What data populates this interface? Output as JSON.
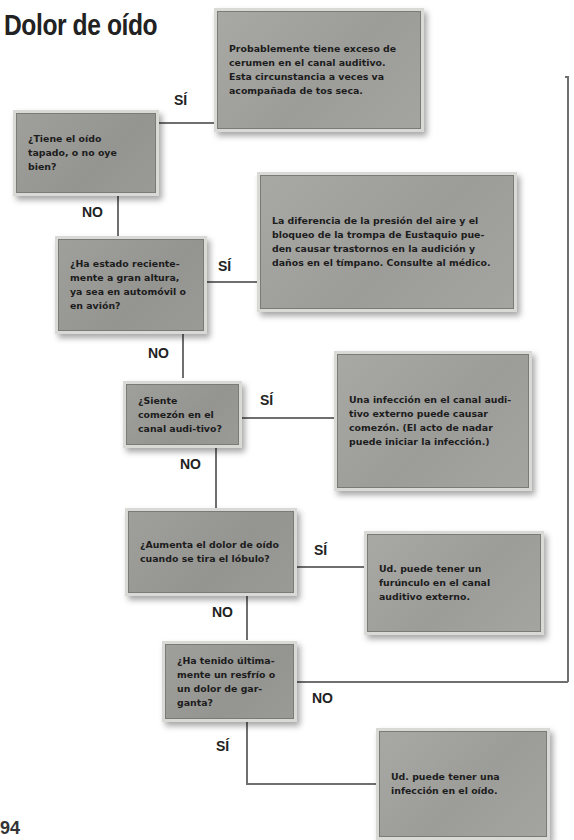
{
  "title": "Dolor de oído",
  "labels": {
    "yes": "SÍ",
    "no": "NO"
  },
  "questions": [
    {
      "id": "q1",
      "text": "¿Tiene el oído tapado, o no oye bien?"
    },
    {
      "id": "q2",
      "text": "¿Ha estado reciente-mente a gran altura, ya sea en automóvil o en avión?"
    },
    {
      "id": "q3",
      "text": "¿Siente comezón en el canal audi-tivo?"
    },
    {
      "id": "q4",
      "text": "¿Aumenta el dolor de oído cuando se tira el lóbulo?"
    },
    {
      "id": "q5",
      "text": "¿Ha tenido última-mente un resfrío o un dolor de gar-ganta?"
    }
  ],
  "answers": [
    {
      "id": "a1",
      "text": "Probablemente tiene exceso de cerumen en el canal auditivo. Esta circunstancia a veces va acompañada de tos seca."
    },
    {
      "id": "a2",
      "text": "La diferencia de la presión del aire y el bloqueo de la trompa de Eustaquio pue-den causar trastornos en la audición y daños en el tímpano. Consulte al médico."
    },
    {
      "id": "a3",
      "text": "Una infección en el canal audi-tivo externo puede causar comezón. (El acto de nadar puede iniciar la infección.)"
    },
    {
      "id": "a4",
      "text": "Ud. puede tener un furúnculo en el canal auditivo externo."
    },
    {
      "id": "a5",
      "text": "Ud. puede tener una infección en el oído."
    }
  ],
  "page_number_fragment": "94"
}
